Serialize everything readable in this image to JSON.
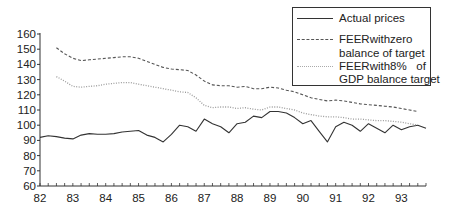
{
  "chart_data": {
    "type": "line",
    "title": "",
    "xlabel": "",
    "ylabel": "",
    "ylim": [
      60,
      160
    ],
    "xlim": [
      82,
      93.75
    ],
    "y_ticks": [
      60,
      70,
      80,
      90,
      100,
      110,
      120,
      130,
      140,
      150,
      160
    ],
    "x_ticks": [
      "82",
      "83",
      "84",
      "85",
      "86",
      "87",
      "88",
      "89",
      "90",
      "91",
      "92",
      "93"
    ],
    "grid": false,
    "legend_position": "upper right",
    "series": [
      {
        "name": "Actual prices",
        "style": "solid",
        "color": "#333333",
        "x": [
          82.0,
          82.25,
          82.5,
          82.75,
          83.0,
          83.25,
          83.5,
          83.75,
          84.0,
          84.25,
          84.5,
          84.75,
          85.0,
          85.25,
          85.5,
          85.75,
          86.0,
          86.25,
          86.5,
          86.75,
          87.0,
          87.25,
          87.5,
          87.75,
          88.0,
          88.25,
          88.5,
          88.75,
          89.0,
          89.25,
          89.5,
          89.75,
          90.0,
          90.25,
          90.5,
          90.75,
          91.0,
          91.25,
          91.5,
          91.75,
          92.0,
          92.25,
          92.5,
          92.75,
          93.0,
          93.25,
          93.5,
          93.75
        ],
        "values": [
          92,
          93,
          92.5,
          91.5,
          91,
          93.5,
          94.5,
          94,
          94,
          94.5,
          95.5,
          96,
          96.5,
          93.5,
          92,
          89,
          94,
          100,
          99,
          96,
          104,
          101,
          99,
          95,
          101,
          102,
          106,
          105,
          109,
          109,
          108,
          105,
          101,
          103,
          96,
          89,
          99,
          102,
          100,
          96,
          101,
          98,
          95,
          100,
          97,
          99,
          100,
          98
        ]
      },
      {
        "name": "FEERwithzero balance of target",
        "style": "dashed",
        "color": "#555555",
        "x": [
          82.5,
          82.75,
          83.0,
          83.25,
          83.5,
          83.75,
          84.0,
          84.25,
          84.5,
          84.75,
          85.0,
          85.25,
          85.5,
          85.75,
          86.0,
          86.25,
          86.5,
          86.75,
          87.0,
          87.25,
          87.5,
          87.75,
          88.0,
          88.25,
          88.5,
          88.75,
          89.0,
          89.25,
          89.5,
          89.75,
          90.0,
          90.25,
          90.5,
          90.75,
          91.0,
          91.25,
          91.5,
          91.75,
          92.0,
          92.25,
          92.5,
          92.75,
          93.0,
          93.25,
          93.5
        ],
        "values": [
          151,
          147,
          144,
          142.5,
          143,
          143.5,
          144,
          144.5,
          145,
          145,
          144,
          142,
          140,
          138,
          137,
          136.5,
          136,
          133,
          129,
          126.5,
          126,
          126,
          125,
          125.5,
          124,
          124,
          125,
          124.5,
          123,
          122,
          120,
          118,
          117,
          116,
          116.5,
          116,
          115,
          114,
          113.5,
          113,
          112.5,
          112,
          111,
          110,
          109
        ]
      },
      {
        "name": "FEERwith8% of GDP balance target",
        "style": "dotted",
        "color": "#9a9a9a",
        "x": [
          82.5,
          82.75,
          83.0,
          83.25,
          83.5,
          83.75,
          84.0,
          84.25,
          84.5,
          84.75,
          85.0,
          85.25,
          85.5,
          85.75,
          86.0,
          86.25,
          86.5,
          86.75,
          87.0,
          87.25,
          87.5,
          87.75,
          88.0,
          88.25,
          88.5,
          88.75,
          89.0,
          89.25,
          89.5,
          89.75,
          90.0,
          90.25,
          90.5,
          90.75,
          91.0,
          91.25,
          91.5,
          91.75,
          92.0,
          92.25,
          92.5,
          92.75,
          93.0,
          93.25,
          93.5
        ],
        "values": [
          132,
          129,
          125.5,
          125,
          125.5,
          126,
          127,
          127.5,
          128,
          128,
          127,
          126,
          125,
          124,
          123,
          122,
          121.5,
          118,
          113,
          111.5,
          112,
          112,
          111,
          111.5,
          110.5,
          110,
          112,
          112,
          111,
          110,
          108,
          107,
          106,
          105.5,
          105.5,
          105,
          104,
          104,
          103.5,
          103,
          103,
          102.5,
          102,
          101,
          100
        ]
      }
    ]
  },
  "legend": {
    "items": [
      {
        "line1": "Actual prices",
        "line2": ""
      },
      {
        "line1": "FEERwithzero",
        "line2": "balance of target"
      },
      {
        "line1": "FEERwith8%   of",
        "line2": "GDP balance target"
      }
    ]
  }
}
